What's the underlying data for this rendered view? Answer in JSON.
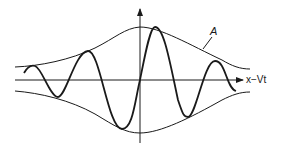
{
  "diagram": {
    "labels": {
      "envelope": "A",
      "x_axis": "x−Vt"
    },
    "colors": {
      "stroke": "#1a1a1a",
      "background": "#ffffff"
    }
  }
}
